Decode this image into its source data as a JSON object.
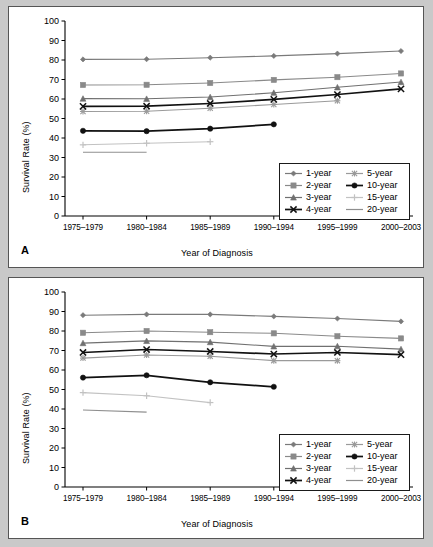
{
  "figure": {
    "background": "#c9c9c9",
    "panels": [
      "A",
      "B"
    ]
  },
  "legend": {
    "items": [
      {
        "label": "1-year",
        "color": "#7a7a7a",
        "marker": "diamond"
      },
      {
        "label": "2-year",
        "color": "#8a8a8a",
        "marker": "square"
      },
      {
        "label": "3-year",
        "color": "#707070",
        "marker": "triangle"
      },
      {
        "label": "4-year",
        "color": "#111111",
        "marker": "x"
      },
      {
        "label": "5-year",
        "color": "#9a9a9a",
        "marker": "asterisk"
      },
      {
        "label": "10-year",
        "color": "#111111",
        "marker": "circle"
      },
      {
        "label": "15-year",
        "color": "#c2c2c2",
        "marker": "plus"
      },
      {
        "label": "20-year",
        "color": "#8f8f8f",
        "marker": "line"
      }
    ],
    "order_display": [
      "1-year",
      "5-year",
      "2-year",
      "10-year",
      "3-year",
      "15-year",
      "4-year",
      "20-year"
    ]
  },
  "chart_data": [
    {
      "panel": "A",
      "type": "line",
      "title": "",
      "xlabel": "Year of Diagnosis",
      "ylabel": "Survival Rate (%)",
      "ylim": [
        0,
        100
      ],
      "yticks": [
        0,
        10,
        20,
        30,
        40,
        50,
        60,
        70,
        80,
        90,
        100
      ],
      "categories": [
        "1975–1979",
        "1980–1984",
        "1985–1989",
        "1990–1994",
        "1995–1999",
        "2000–2003"
      ],
      "grid": false,
      "legend_position": "lower-right",
      "series": [
        {
          "name": "1-year",
          "color": "#7a7a7a",
          "marker": "diamond",
          "values": [
            80.3,
            80.4,
            81.2,
            82.1,
            83.3,
            84.6
          ]
        },
        {
          "name": "2-year",
          "color": "#8a8a8a",
          "marker": "square",
          "values": [
            67.2,
            67.3,
            68.2,
            69.8,
            71.2,
            73.1
          ]
        },
        {
          "name": "3-year",
          "color": "#707070",
          "marker": "triangle",
          "values": [
            60.2,
            60.1,
            61.0,
            63.2,
            66.0,
            68.7
          ]
        },
        {
          "name": "4-year",
          "color": "#111111",
          "marker": "x",
          "values": [
            56.2,
            56.3,
            57.7,
            59.8,
            62.3,
            65.2
          ]
        },
        {
          "name": "5-year",
          "color": "#9a9a9a",
          "marker": "asterisk",
          "values": [
            53.6,
            53.7,
            55.3,
            57.2,
            59.1,
            null
          ]
        },
        {
          "name": "10-year",
          "color": "#111111",
          "marker": "circle",
          "values": [
            43.7,
            43.5,
            44.8,
            47.0,
            null,
            null
          ]
        },
        {
          "name": "15-year",
          "color": "#c2c2c2",
          "marker": "plus",
          "values": [
            36.5,
            37.3,
            38.1,
            null,
            null,
            null
          ]
        },
        {
          "name": "20-year",
          "color": "#8f8f8f",
          "marker": "line",
          "values": [
            32.7,
            32.7,
            null,
            null,
            null,
            null
          ]
        }
      ]
    },
    {
      "panel": "B",
      "type": "line",
      "title": "",
      "xlabel": "Year of Diagnosis",
      "ylabel": "Survival Rate (%)",
      "ylim": [
        0,
        100
      ],
      "yticks": [
        0,
        10,
        20,
        30,
        40,
        50,
        60,
        70,
        80,
        90,
        100
      ],
      "categories": [
        "1975–1979",
        "1980–1984",
        "1985–1989",
        "1990–1994",
        "1995–1999",
        "2000–2003"
      ],
      "grid": false,
      "legend_position": "lower-right",
      "series": [
        {
          "name": "1-year",
          "color": "#7a7a7a",
          "marker": "diamond",
          "values": [
            88.1,
            88.5,
            88.5,
            87.5,
            86.4,
            84.9
          ]
        },
        {
          "name": "2-year",
          "color": "#8a8a8a",
          "marker": "square",
          "values": [
            79.1,
            80.0,
            79.4,
            78.8,
            77.3,
            76.2
          ]
        },
        {
          "name": "3-year",
          "color": "#707070",
          "marker": "triangle",
          "values": [
            73.8,
            74.9,
            74.3,
            72.1,
            72.2,
            70.7
          ]
        },
        {
          "name": "4-year",
          "color": "#111111",
          "marker": "x",
          "values": [
            69.0,
            70.5,
            69.5,
            68.2,
            69.0,
            67.9
          ]
        },
        {
          "name": "5-year",
          "color": "#9a9a9a",
          "marker": "asterisk",
          "values": [
            66.1,
            67.7,
            67.0,
            64.8,
            64.8,
            null
          ]
        },
        {
          "name": "10-year",
          "color": "#111111",
          "marker": "circle",
          "values": [
            56.1,
            57.3,
            53.7,
            51.4,
            null,
            null
          ]
        },
        {
          "name": "15-year",
          "color": "#c2c2c2",
          "marker": "plus",
          "values": [
            48.4,
            46.8,
            43.3,
            null,
            null,
            null
          ]
        },
        {
          "name": "20-year",
          "color": "#8f8f8f",
          "marker": "line",
          "values": [
            39.5,
            38.4,
            null,
            null,
            null,
            null
          ]
        }
      ]
    }
  ]
}
